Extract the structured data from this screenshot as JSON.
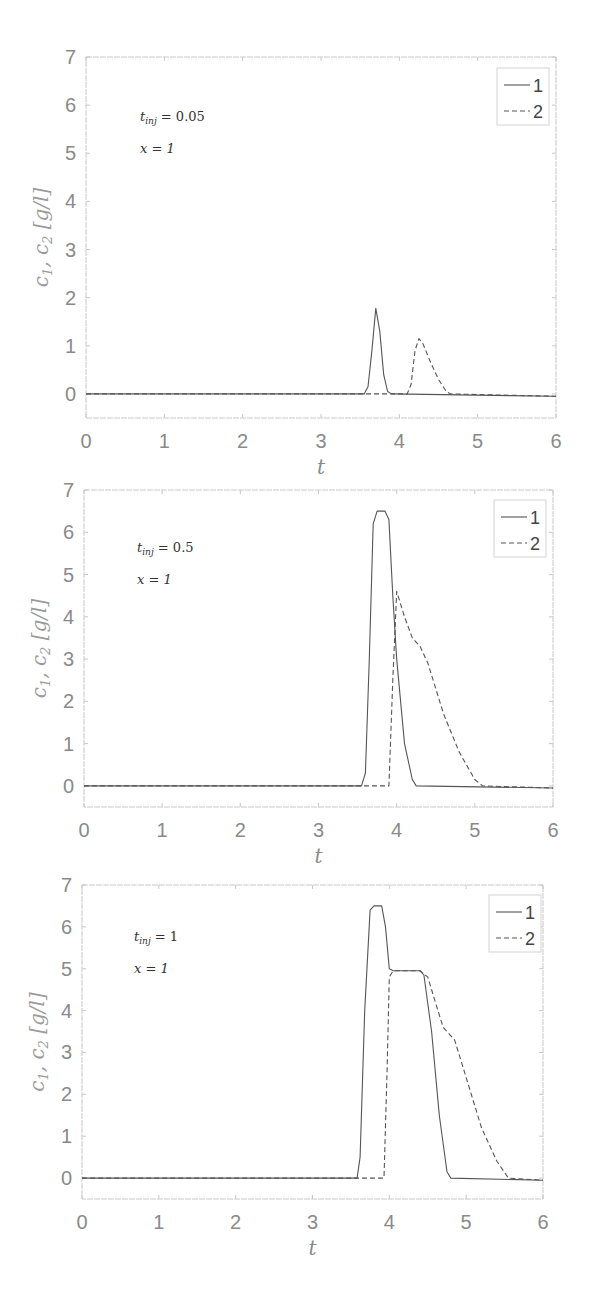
{
  "chart_data": [
    {
      "type": "line",
      "title": "",
      "xlabel": "t",
      "ylabel": "c1, c2 [g/l]",
      "xlim": [
        0,
        6
      ],
      "ylim": [
        -0.5,
        7
      ],
      "xticks": [
        "0",
        "1",
        "2",
        "3",
        "4",
        "5",
        "6"
      ],
      "yticks": [
        "0",
        "1",
        "2",
        "3",
        "4",
        "5",
        "6",
        "7"
      ],
      "grid": false,
      "legend_position": "upper right",
      "annotations": [
        "t_inj = 0.05",
        "x = 1"
      ],
      "series": [
        {
          "name": "1",
          "style": "solid",
          "x": [
            0,
            3.55,
            3.6,
            3.65,
            3.7,
            3.75,
            3.8,
            3.85,
            3.9,
            6
          ],
          "y": [
            0,
            0,
            0.15,
            0.9,
            1.78,
            1.3,
            0.4,
            0.05,
            0,
            -0.05
          ]
        },
        {
          "name": "2",
          "style": "dashed",
          "x": [
            0,
            4.1,
            4.15,
            4.2,
            4.25,
            4.3,
            4.4,
            4.5,
            4.6,
            4.65,
            6
          ],
          "y": [
            0,
            0,
            0.2,
            0.9,
            1.15,
            1.05,
            0.65,
            0.3,
            0.05,
            0,
            -0.05
          ]
        }
      ]
    },
    {
      "type": "line",
      "title": "",
      "xlabel": "t",
      "ylabel": "c1, c2 [g/l]",
      "xlim": [
        0,
        6
      ],
      "ylim": [
        -0.5,
        7
      ],
      "xticks": [
        "0",
        "1",
        "2",
        "3",
        "4",
        "5",
        "6"
      ],
      "yticks": [
        "0",
        "1",
        "2",
        "3",
        "4",
        "5",
        "6",
        "7"
      ],
      "grid": false,
      "legend_position": "upper right",
      "annotations": [
        "t_inj = 0.5",
        "x = 1"
      ],
      "series": [
        {
          "name": "1",
          "style": "solid",
          "x": [
            0,
            3.55,
            3.6,
            3.65,
            3.7,
            3.75,
            3.85,
            3.9,
            3.95,
            4.0,
            4.1,
            4.2,
            4.25,
            6
          ],
          "y": [
            0,
            0,
            0.3,
            3.0,
            6.2,
            6.5,
            6.5,
            6.3,
            4.5,
            3.0,
            1.0,
            0.15,
            0,
            -0.05
          ]
        },
        {
          "name": "2",
          "style": "dashed",
          "x": [
            0,
            3.9,
            3.95,
            4.0,
            4.1,
            4.2,
            4.3,
            4.4,
            4.6,
            4.8,
            5.0,
            5.1,
            6
          ],
          "y": [
            0,
            0,
            2.5,
            4.6,
            4.0,
            3.5,
            3.3,
            2.9,
            1.7,
            0.8,
            0.15,
            0,
            -0.05
          ]
        }
      ]
    },
    {
      "type": "line",
      "title": "",
      "xlabel": "t",
      "ylabel": "c1, c2 [g/l]",
      "xlim": [
        0,
        6
      ],
      "ylim": [
        -0.5,
        7
      ],
      "xticks": [
        "0",
        "1",
        "2",
        "3",
        "4",
        "5",
        "6"
      ],
      "yticks": [
        "0",
        "1",
        "2",
        "3",
        "4",
        "5",
        "6",
        "7"
      ],
      "grid": false,
      "legend_position": "upper right",
      "annotations": [
        "t_inj = 1",
        "x = 1"
      ],
      "series": [
        {
          "name": "1",
          "style": "solid",
          "x": [
            0,
            3.58,
            3.62,
            3.68,
            3.75,
            3.8,
            3.9,
            3.95,
            4.0,
            4.05,
            4.4,
            4.45,
            4.55,
            4.65,
            4.75,
            4.8,
            6
          ],
          "y": [
            0,
            0,
            0.5,
            4.0,
            6.4,
            6.5,
            6.5,
            6.0,
            5.0,
            4.95,
            4.95,
            4.85,
            3.5,
            1.5,
            0.15,
            0,
            -0.05
          ]
        },
        {
          "name": "2",
          "style": "dashed",
          "x": [
            0,
            3.93,
            3.97,
            4.0,
            4.05,
            4.4,
            4.5,
            4.6,
            4.7,
            4.85,
            5.0,
            5.2,
            5.4,
            5.55,
            6
          ],
          "y": [
            0,
            0,
            2.5,
            4.8,
            4.95,
            4.95,
            4.8,
            4.2,
            3.6,
            3.3,
            2.4,
            1.2,
            0.4,
            0,
            -0.05
          ]
        }
      ]
    }
  ],
  "charts": [
    {
      "annotation_1_main": "t",
      "annotation_1_sub": "inj",
      "annotation_1_rest": " = 0.05",
      "annotation_2": "x = 1"
    },
    {
      "annotation_1_main": "t",
      "annotation_1_sub": "inj",
      "annotation_1_rest": " = 0.5",
      "annotation_2": "x = 1"
    },
    {
      "annotation_1_main": "t",
      "annotation_1_sub": "inj",
      "annotation_1_rest": " = 1",
      "annotation_2": "x = 1"
    }
  ],
  "legend": {
    "series_1": "1",
    "series_2": "2"
  },
  "axis": {
    "xlabel": "t",
    "ylabel_c": "c",
    "ylabel_sub1": "1",
    "ylabel_sep": ", ",
    "ylabel_sub2": "2",
    "ylabel_units": " [g/l]"
  },
  "colors": {
    "axes": "#c8c8c8",
    "line": "#555555",
    "tick_text": "#8a8a8a"
  }
}
